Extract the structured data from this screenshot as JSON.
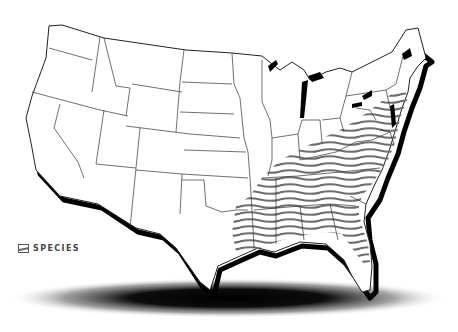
{
  "map": {
    "title": "Species range map of the contiguous United States",
    "region": "Contiguous United States",
    "range_area": "Southeastern and Mid-Atlantic United States",
    "range_style": "gray wavy horizontal hatch",
    "colors": {
      "background": "#ffffff",
      "state_border": "#333333",
      "coast_shadow": "#000000",
      "hatch": "#6e6e6e",
      "ground_shadow": "#000000"
    }
  },
  "legend": {
    "items": [
      {
        "label": "SPECIES",
        "symbol": "hatched-swatch"
      }
    ]
  }
}
